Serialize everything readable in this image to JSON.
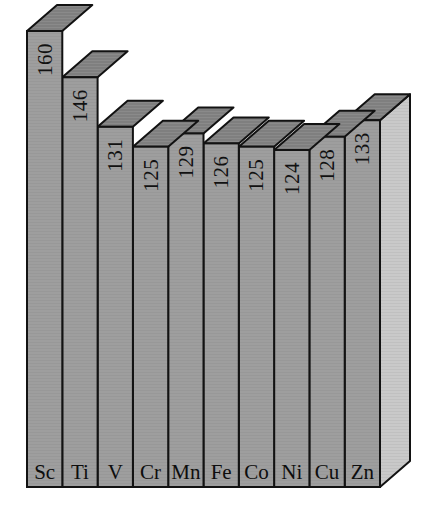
{
  "chart_data": {
    "type": "bar",
    "title": "",
    "subtitle": "",
    "xlabel": "",
    "ylabel": "",
    "categories": [
      "Sc",
      "Ti",
      "V",
      "Cr",
      "Mn",
      "Fe",
      "Co",
      "Ni",
      "Cu",
      "Zn"
    ],
    "values": [
      160,
      146,
      131,
      125,
      129,
      126,
      125,
      124,
      128,
      133
    ],
    "value_labels": [
      "160",
      "146",
      "131",
      "125",
      "129",
      "126",
      "125",
      "124",
      "128",
      "133"
    ],
    "category_labels": [
      "Sc",
      "Ti",
      "V",
      "Cr",
      "Mn",
      "Fe",
      "Co",
      "Ni",
      "Cu",
      "Zn"
    ],
    "ylim": [
      0,
      160
    ],
    "grid": false,
    "legend": null,
    "axis_visible": false,
    "tick_labels": [],
    "annotations": [],
    "style": {
      "three_d": true,
      "label_rotation_degrees": -90,
      "front_face_color": "#9e9e9e",
      "top_face_color": "#7f7f7f",
      "side_face_color": "#c9c9c9",
      "outline_color": "#121212",
      "background_color": "#ffffff"
    }
  },
  "bars": [
    {
      "symbol": "Sc",
      "value_label": "160"
    },
    {
      "symbol": "Ti",
      "value_label": "146"
    },
    {
      "symbol": "V",
      "value_label": "131"
    },
    {
      "symbol": "Cr",
      "value_label": "125"
    },
    {
      "symbol": "Mn",
      "value_label": "129"
    },
    {
      "symbol": "Fe",
      "value_label": "126"
    },
    {
      "symbol": "Co",
      "value_label": "125"
    },
    {
      "symbol": "Ni",
      "value_label": "124"
    },
    {
      "symbol": "Cu",
      "value_label": "128"
    },
    {
      "symbol": "Zn",
      "value_label": "133"
    }
  ]
}
